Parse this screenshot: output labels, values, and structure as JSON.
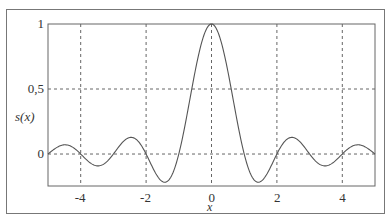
{
  "chart_data": {
    "type": "line",
    "title": "",
    "xlabel": "x",
    "ylabel": "s(x)",
    "xlim": [
      -5,
      5
    ],
    "ylim": [
      -0.246,
      1
    ],
    "grid": true,
    "grid_style": "dashed",
    "x_ticks": [
      -4,
      -2,
      0,
      2,
      4
    ],
    "x_tick_labels": [
      "-4",
      "-2",
      "0",
      "2",
      "4"
    ],
    "y_ticks": [
      0,
      0.5,
      1
    ],
    "y_tick_labels": [
      "0",
      "0,5",
      "1"
    ],
    "function": "sin(pi*x)/(pi*x)",
    "series": [
      {
        "name": "s(x)",
        "color": "#555555",
        "x": [
          -5,
          -4.5,
          -4,
          -3.5,
          -3,
          -2.5,
          -2,
          -1.5,
          -1,
          -0.5,
          0,
          0.5,
          1,
          1.5,
          2,
          2.5,
          3,
          3.5,
          4,
          4.5,
          5
        ],
        "values": [
          0,
          0.071,
          0,
          -0.091,
          0,
          0.127,
          0,
          -0.212,
          0,
          0.637,
          1,
          0.637,
          0,
          -0.212,
          0,
          0.127,
          0,
          -0.091,
          0,
          0.071,
          0
        ]
      }
    ]
  }
}
